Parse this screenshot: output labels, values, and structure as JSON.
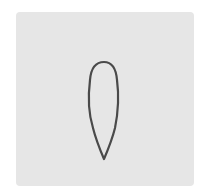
{
  "figure": {
    "background_color": "#ffffff",
    "tile_color": "#e6e6e6",
    "shape": {
      "icon": "petal-outline-icon",
      "stroke_color": "#4a4a4a",
      "fill_color": "none"
    }
  }
}
